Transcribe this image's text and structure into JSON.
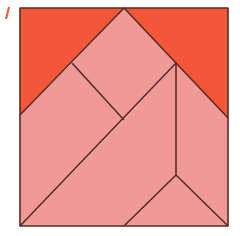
{
  "figure": {
    "type": "tangram-square",
    "colors": {
      "highlight": "#F4563A",
      "piece": "#F09A98",
      "outline": "#5A2A24",
      "background": "#FFFFFF"
    },
    "square": {
      "x": 20,
      "y": 8,
      "size": 208
    },
    "pieces": [
      {
        "name": "left-corner-triangle",
        "fill": "highlight",
        "points": "20,8 124,8 20,115"
      },
      {
        "name": "right-corner-triangle",
        "fill": "highlight",
        "points": "124,8 228,8 228,118"
      },
      {
        "name": "top-square",
        "fill": "piece",
        "points": "124,8 176,63 124,120 72,63"
      },
      {
        "name": "left-triangle",
        "fill": "piece",
        "points": "20,115 72,63 124,120 20,226"
      },
      {
        "name": "parallelogram",
        "fill": "piece",
        "points": "124,120 176,63 176,175 124,226 20,226"
      },
      {
        "name": "right-parallelogram",
        "fill": "piece",
        "points": "176,63 228,118 228,226 176,175"
      },
      {
        "name": "bottom-triangle",
        "fill": "piece",
        "points": "124,226 176,175 228,226"
      }
    ],
    "lines": [
      {
        "name": "square-border",
        "d": "M20,8 L228,8 L228,226 L20,226 Z"
      },
      {
        "name": "left-diagonal",
        "d": "M20,115 L124,8"
      },
      {
        "name": "right-diagonal",
        "d": "M124,8 L228,118"
      },
      {
        "name": "inner-diagonal",
        "d": "M72,63 L124,120"
      },
      {
        "name": "long-diagonal",
        "d": "M20,226 L176,63"
      },
      {
        "name": "vertical-divider",
        "d": "M176,63 L176,175"
      },
      {
        "name": "bottom-left-edge",
        "d": "M176,175 L124,226"
      },
      {
        "name": "bottom-right-edge",
        "d": "M176,175 L228,226"
      }
    ]
  }
}
